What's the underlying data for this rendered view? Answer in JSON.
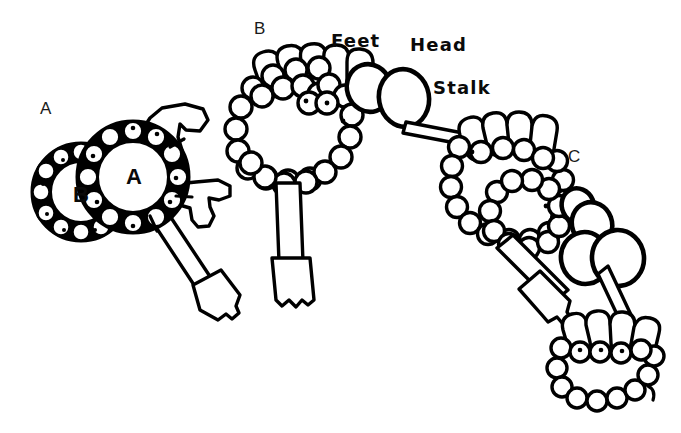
{
  "figure": {
    "background_color": "#ffffff",
    "ink_color": "#000000",
    "width": 681,
    "height": 433,
    "style": "black-and-white line drawing"
  },
  "panels": [
    {
      "id": "A",
      "label": "A",
      "label_x": 40,
      "label_y": 100,
      "description": "Two overlapping beaded rings seen face-on with filled interstitial shading, one stalk-and-foot and two hook-shaped feet"
    },
    {
      "id": "B",
      "label": "B",
      "label_x": 254,
      "label_y": 20,
      "description": "Two beaded rings tilted, with elongated feet along the top, a head and stalk, and a splayed foot"
    },
    {
      "id": "C",
      "label": "C",
      "label_x": 568,
      "label_y": 148,
      "description": "Beaded ring with head lobes and a stalk descending to a further beaded ring"
    }
  ],
  "ring_center_labels": [
    {
      "text": "A",
      "x": 133,
      "y": 175
    },
    {
      "text": "B",
      "x": 80,
      "y": 196
    }
  ],
  "part_labels": [
    {
      "name": "feet-label",
      "text": "Feet",
      "x": 331,
      "y": 32
    },
    {
      "name": "head-label",
      "text": "Head",
      "x": 410,
      "y": 36
    },
    {
      "name": "stalk-label",
      "text": "Stalk",
      "x": 433,
      "y": 79
    }
  ]
}
